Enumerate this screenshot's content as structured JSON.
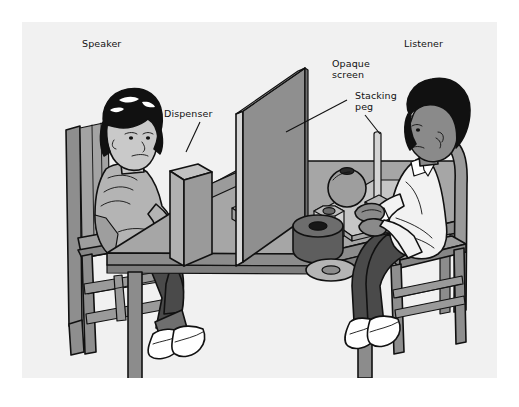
{
  "figure": {
    "kind": "line-art illustration",
    "background_color": "#f1f1f1",
    "outer_color": "#ffffff",
    "line_color": "#111111"
  },
  "labels": [
    {
      "id": "speaker",
      "text": "Speaker",
      "x": 82,
      "y": 38,
      "leader": false
    },
    {
      "id": "listener",
      "text": "Listener",
      "x": 404,
      "y": 38,
      "leader": false
    },
    {
      "id": "dispenser",
      "text": "Dispenser",
      "x": 164,
      "y": 108,
      "leader": true
    },
    {
      "id": "opaque-screen",
      "text": "Opaque\nscreen",
      "x": 332,
      "y": 58,
      "leader": true
    },
    {
      "id": "stacking-peg",
      "text": "Stacking\npeg",
      "x": 355,
      "y": 90,
      "leader": true
    }
  ],
  "people": {
    "speaker": {
      "role": "Speaker",
      "position": "left",
      "hair": "black bob with highlights",
      "skin_tone": "#c9c9c9",
      "top": "light gray sweater",
      "pants": "dark gray",
      "shoes": "white sneakers",
      "facing": "right"
    },
    "listener": {
      "role": "Listener",
      "position": "right",
      "hair": "black afro",
      "skin_tone": "#8a8a8a",
      "top": "white shirt",
      "pants": "dark gray",
      "shoes": "white sneakers",
      "facing": "left"
    }
  },
  "objects": [
    {
      "name": "table",
      "side": "center",
      "color": "#a6a6a6"
    },
    {
      "name": "opaque-screen",
      "side": "center",
      "color": "#8f8f8f"
    },
    {
      "name": "dispenser",
      "side": "left",
      "color": "#b5b5b5",
      "shape": "tall rectangular box"
    },
    {
      "name": "stacking-peg",
      "side": "left",
      "color": "#cfcfcf",
      "shape": "vertical rod on square base"
    },
    {
      "name": "stacking-peg",
      "side": "right",
      "color": "#cfcfcf",
      "shape": "vertical rod on square base"
    },
    {
      "name": "work-mat",
      "side": "right",
      "color": "#c6c6c6",
      "shape": "flat board"
    },
    {
      "name": "sphere",
      "side": "right",
      "color": "#9e9e9e",
      "shape": "ball with hole"
    },
    {
      "name": "hex-block",
      "side": "right",
      "color": "#d2d2d2",
      "shape": "hexagonal ring"
    },
    {
      "name": "dark-cylinder",
      "side": "right",
      "color": "#5e5e5e",
      "shape": "cylinder with hole"
    },
    {
      "name": "flat-washer",
      "side": "right",
      "color": "#b5b5b5",
      "shape": "flat ring"
    },
    {
      "name": "chair",
      "side": "left",
      "color": "#9a9a9a",
      "shape": "wooden ladder-back chair"
    },
    {
      "name": "chair",
      "side": "right",
      "color": "#9a9a9a",
      "shape": "wooden ladder-back chair"
    }
  ]
}
